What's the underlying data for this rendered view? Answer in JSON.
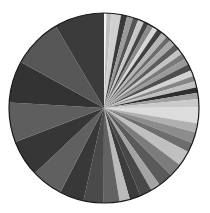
{
  "chart_data": {
    "type": "pie",
    "title": "",
    "start_angle_deg": 0,
    "direction": "clockwise",
    "center": [
      104,
      108
    ],
    "radius": 95,
    "legend": "none",
    "slices": [
      {
        "label": "s1",
        "value": 0.4,
        "color": "#f4f4f4"
      },
      {
        "label": "s2",
        "value": 0.8,
        "color": "#bdbdbd"
      },
      {
        "label": "s3",
        "value": 1.6,
        "color": "#d0d0d0"
      },
      {
        "label": "s4",
        "value": 1.0,
        "color": "#3a3a3a"
      },
      {
        "label": "s5",
        "value": 1.0,
        "color": "#9a9a9a"
      },
      {
        "label": "s6",
        "value": 0.9,
        "color": "#555555"
      },
      {
        "label": "s7",
        "value": 1.0,
        "color": "#c8c8c8"
      },
      {
        "label": "s8",
        "value": 0.8,
        "color": "#454545"
      },
      {
        "label": "s9",
        "value": 0.9,
        "color": "#8a8a8a"
      },
      {
        "label": "s10",
        "value": 0.8,
        "color": "#d8d8d8"
      },
      {
        "label": "s11",
        "value": 0.9,
        "color": "#404040"
      },
      {
        "label": "s12",
        "value": 1.0,
        "color": "#b5b5b5"
      },
      {
        "label": "s13",
        "value": 0.8,
        "color": "#6a6a6a"
      },
      {
        "label": "s14",
        "value": 1.0,
        "color": "#a8a8a8"
      },
      {
        "label": "s15",
        "value": 1.0,
        "color": "#5c5c5c"
      },
      {
        "label": "s16",
        "value": 0.9,
        "color": "#c4c4c4"
      },
      {
        "label": "s17",
        "value": 1.0,
        "color": "#7a7a7a"
      },
      {
        "label": "s18",
        "value": 1.0,
        "color": "#999999"
      },
      {
        "label": "s19",
        "value": 1.1,
        "color": "#4e4e4e"
      },
      {
        "label": "s20",
        "value": 1.0,
        "color": "#d2d2d2"
      },
      {
        "label": "s21",
        "value": 0.9,
        "color": "#858585"
      },
      {
        "label": "s22",
        "value": 1.0,
        "color": "#bfbfbf"
      },
      {
        "label": "s23",
        "value": 0.9,
        "color": "#2e2e2e"
      },
      {
        "label": "s24",
        "value": 1.0,
        "color": "#a0a0a0"
      },
      {
        "label": "s25",
        "value": 1.4,
        "color": "#cacaca"
      },
      {
        "label": "s26",
        "value": 2.6,
        "color": "#dcdcdc"
      },
      {
        "label": "s27",
        "value": 1.5,
        "color": "#b0b0b0"
      },
      {
        "label": "s28",
        "value": 1.8,
        "color": "#8c8c8c"
      },
      {
        "label": "s29",
        "value": 1.6,
        "color": "#6e6e6e"
      },
      {
        "label": "s30",
        "value": 2.5,
        "color": "#c0c0c0"
      },
      {
        "label": "s31",
        "value": 2.2,
        "color": "#7c7c7c"
      },
      {
        "label": "s32",
        "value": 2.4,
        "color": "#5a5a5a"
      },
      {
        "label": "s33",
        "value": 1.6,
        "color": "#a4a4a4"
      },
      {
        "label": "s34",
        "value": 2.0,
        "color": "#484848"
      },
      {
        "label": "s35",
        "value": 1.8,
        "color": "#3c3c3c"
      },
      {
        "label": "s36",
        "value": 1.7,
        "color": "#bababa"
      },
      {
        "label": "s37",
        "value": 2.6,
        "color": "#626262"
      },
      {
        "label": "s38",
        "value": 3.3,
        "color": "#4a4a4a"
      },
      {
        "label": "s39",
        "value": 4.0,
        "color": "#383838"
      },
      {
        "label": "s40",
        "value": 5.2,
        "color": "#606060"
      },
      {
        "label": "s41",
        "value": 6.0,
        "color": "#363636"
      },
      {
        "label": "s42",
        "value": 6.5,
        "color": "#5e5e5e"
      },
      {
        "label": "s43",
        "value": 6.9,
        "color": "#333333"
      },
      {
        "label": "s44",
        "value": 8.2,
        "color": "#575757"
      },
      {
        "label": "s45",
        "value": 8.2,
        "color": "#3b3b3b"
      }
    ]
  }
}
